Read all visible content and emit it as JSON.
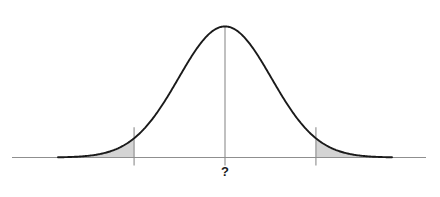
{
  "chart_data": {
    "type": "line",
    "title": "",
    "subtitle": "",
    "xlabel": "",
    "ylabel": "",
    "center_label": "?",
    "distribution": "normal",
    "mean": 0,
    "std": 1,
    "x": [
      -3.6,
      -3.4,
      -3.2,
      -3.0,
      -2.8,
      -2.6,
      -2.4,
      -2.2,
      -2.0,
      -1.8,
      -1.6,
      -1.4,
      -1.2,
      -1.0,
      -0.8,
      -0.6,
      -0.4,
      -0.2,
      0.0,
      0.2,
      0.4,
      0.6,
      0.8,
      1.0,
      1.2,
      1.4,
      1.6,
      1.8,
      2.0,
      2.2,
      2.4,
      2.6,
      2.8,
      3.0,
      3.2,
      3.4,
      3.6
    ],
    "y": [
      0.0006,
      0.0012,
      0.0024,
      0.0044,
      0.0079,
      0.0136,
      0.0224,
      0.0355,
      0.054,
      0.079,
      0.1109,
      0.1497,
      0.1942,
      0.242,
      0.2897,
      0.3332,
      0.3683,
      0.391,
      0.3989,
      0.391,
      0.3683,
      0.3332,
      0.2897,
      0.242,
      0.1942,
      0.1497,
      0.1109,
      0.079,
      0.054,
      0.0355,
      0.0224,
      0.0136,
      0.0079,
      0.0044,
      0.0024,
      0.0012,
      0.0006
    ],
    "xlim": [
      -3.6,
      3.6
    ],
    "ylim": [
      0,
      0.42
    ],
    "grid": false,
    "legend": null,
    "shaded_regions": [
      {
        "name": "left-tail",
        "from": -3.6,
        "to": -1.96,
        "fill": "#d4d4d4"
      },
      {
        "name": "right-tail",
        "from": 1.96,
        "to": 3.6,
        "fill": "#d4d4d4"
      }
    ],
    "vertical_lines": [
      {
        "name": "left-critical-line",
        "x": -1.96
      },
      {
        "name": "center-line",
        "x": 0.0
      },
      {
        "name": "right-critical-line",
        "x": 1.96
      }
    ],
    "annotations": [
      {
        "name": "center-question-mark",
        "text": "?",
        "x": 0.0,
        "position": "below-axis"
      }
    ],
    "colors": {
      "curve": "#1a1a1a",
      "axis": "#808080",
      "shade": "#d4d4d4",
      "shade_stroke": "#8c8c8c",
      "vline": "#8c8c8c",
      "label": "#1a1a1a",
      "background": "#ffffff"
    }
  }
}
